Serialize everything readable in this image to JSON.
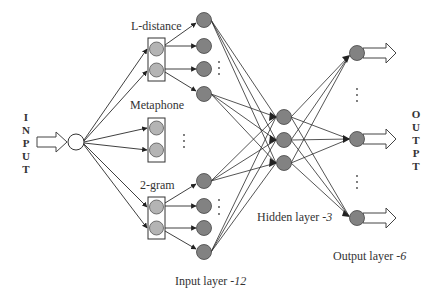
{
  "diagram": {
    "input_side_label": [
      "I",
      "N",
      "P",
      "U",
      "T"
    ],
    "output_side_label": [
      "O",
      "U",
      "T",
      "P",
      "T"
    ],
    "groups": [
      {
        "label": "L-distance"
      },
      {
        "label": "Metaphone"
      },
      {
        "label": "2-gram"
      }
    ],
    "layers": {
      "input": {
        "prefix": "Input layer -",
        "count": "12"
      },
      "hidden": {
        "prefix": "Hidden layer -",
        "count": "3"
      },
      "output": {
        "prefix": "Output layer -",
        "count": "6"
      }
    },
    "colors": {
      "node_light": "#b4b4b4",
      "node_dark": "#828282",
      "node_stroke": "#444444",
      "line": "#2a2a2a"
    }
  }
}
